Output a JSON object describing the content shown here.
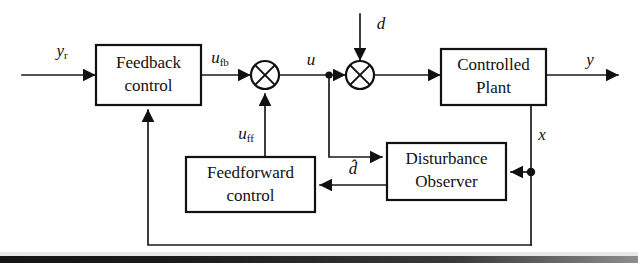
{
  "diagram": {
    "type": "control-block-diagram",
    "blocks": [
      {
        "id": "feedback-control",
        "label_line1": "Feedback",
        "label_line2": "control",
        "x": 96,
        "y": 45,
        "w": 105,
        "h": 60
      },
      {
        "id": "controlled-plant",
        "label_line1": "Controlled",
        "label_line2": "Plant",
        "x": 441,
        "y": 49,
        "w": 105,
        "h": 56
      },
      {
        "id": "feedforward-control",
        "label_line1": "Feedforward",
        "label_line2": "control",
        "x": 186,
        "y": 157,
        "w": 129,
        "h": 55
      },
      {
        "id": "disturbance-observer",
        "label_line1": "Disturbance",
        "label_line2": "Observer",
        "x": 387,
        "y": 143,
        "w": 119,
        "h": 57
      }
    ],
    "sum_junctions": [
      {
        "id": "sum-ufb-uff",
        "cx": 265,
        "cy": 75,
        "r": 14
      },
      {
        "id": "sum-u-d",
        "cx": 360,
        "cy": 75,
        "r": 14
      }
    ],
    "signals": {
      "reference": {
        "base": "y",
        "sub": "r",
        "x": 62,
        "y": 52
      },
      "feedback_command": {
        "base": "u",
        "sub": "fb",
        "x": 220,
        "y": 59
      },
      "control_input": {
        "base": "u",
        "sub": "",
        "x": 311,
        "y": 61
      },
      "disturbance": {
        "base": "d",
        "sub": "",
        "x": 381,
        "y": 25
      },
      "plant_output": {
        "base": "y",
        "sub": "",
        "x": 590,
        "y": 61
      },
      "state": {
        "base": "x",
        "sub": "",
        "x": 542,
        "y": 136
      },
      "feedforward_command": {
        "base": "u",
        "sub": "ff",
        "x": 246,
        "y": 135
      },
      "estimated_disturbance": {
        "base": "d̂",
        "sub": "",
        "x": 353,
        "y": 170
      }
    },
    "colors": {
      "line": "#1a1a1a",
      "box_stroke": "#111111",
      "box_fill": "#ffffff",
      "text": "#111111",
      "background": "#ffffff",
      "page_bar": "#1c1c1c"
    },
    "connections": [
      {
        "id": "wire-ref-to-feedback",
        "from": "reference-input",
        "to": "feedback-control"
      },
      {
        "id": "wire-feedback-to-sum1",
        "from": "feedback-control",
        "to": "sum-ufb-uff"
      },
      {
        "id": "wire-sum1-to-sum2",
        "from": "sum-ufb-uff",
        "to": "sum-u-d"
      },
      {
        "id": "wire-disturbance-to-sum2",
        "from": "disturbance-input",
        "to": "sum-u-d"
      },
      {
        "id": "wire-sum2-to-plant",
        "from": "sum-u-d",
        "to": "controlled-plant"
      },
      {
        "id": "wire-plant-to-output",
        "from": "controlled-plant",
        "to": "output-y"
      },
      {
        "id": "wire-u-tap-to-observer",
        "from": "u-tap-node",
        "to": "disturbance-observer"
      },
      {
        "id": "wire-state-to-observer",
        "from": "state-tap-node",
        "to": "disturbance-observer"
      },
      {
        "id": "wire-observer-to-feedforward",
        "from": "disturbance-observer",
        "to": "feedforward-control"
      },
      {
        "id": "wire-feedforward-to-sum1",
        "from": "feedforward-control",
        "to": "sum-ufb-uff"
      },
      {
        "id": "wire-state-feedback-loop",
        "from": "state-tap-node",
        "to": "feedback-control"
      }
    ]
  }
}
